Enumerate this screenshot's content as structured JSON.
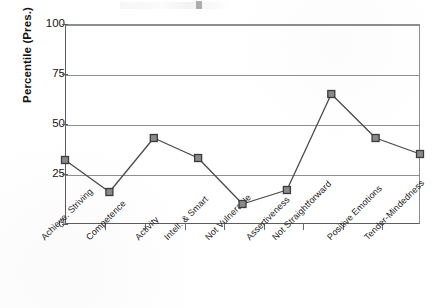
{
  "chart_data": {
    "type": "line",
    "title": "",
    "xlabel": "",
    "ylabel": "Percentile (Pres.)",
    "categories": [
      "Achieve. Striving",
      "Competence",
      "Activity",
      "Intell. & Smart",
      "Not Vulnerable",
      "Assertiveness",
      "Not Straightforward",
      "Positive Emotions",
      "Tender-Mindedness"
    ],
    "values": [
      32,
      16,
      43,
      33,
      10,
      17,
      65,
      43,
      35
    ],
    "ylim": [
      0,
      100
    ],
    "yticks": [
      "0",
      "25",
      "50",
      "75",
      "100"
    ],
    "ytick_values": [
      0,
      25,
      50,
      75,
      100
    ],
    "grid": true,
    "legend": "none",
    "marker": "square",
    "series_name": "Percentile (Pres.)",
    "colors": {
      "line": "#4a4a4a",
      "marker_fill": "#8a8a8a",
      "marker_edge": "#3b3b3b",
      "grid": "#8f8f8f",
      "axis": "#5d5d5d",
      "text": "#161616",
      "background": "#ffffff"
    }
  }
}
